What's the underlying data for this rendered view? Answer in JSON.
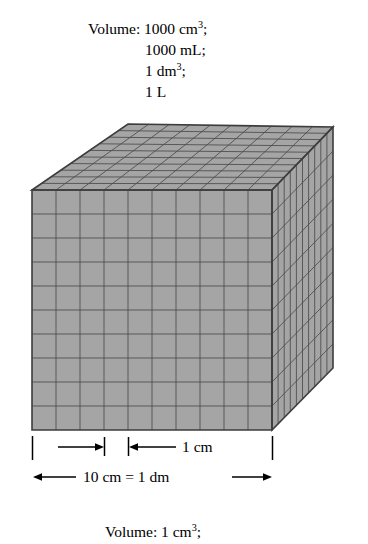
{
  "figure": {
    "title_top": {
      "lines": [
        {
          "text": "Volume: 1000 cm3;",
          "prefix": "Volume: 1000 cm",
          "sup": "3",
          "suffix": ";",
          "indent": false
        },
        {
          "text": "1000 mL;",
          "prefix": "1000 mL;",
          "sup": "",
          "suffix": "",
          "indent": true
        },
        {
          "text": "1 dm3;",
          "prefix": "1 dm",
          "sup": "3",
          "suffix": ";",
          "indent": true
        },
        {
          "text": "1 L",
          "prefix": "1 L",
          "sup": "",
          "suffix": "",
          "indent": true
        }
      ]
    },
    "caption_bottom": {
      "prefix": "Volume: 1 cm",
      "sup": "3",
      "suffix": ";"
    },
    "dimensions": {
      "unit_label": "1 cm",
      "total_label": "10 cm = 1 dm"
    },
    "cube": {
      "divisions_x": 10,
      "divisions_y": 10,
      "divisions_z": 10,
      "total_unit_cubes": 1000
    },
    "colors": {
      "background": "#ffffff",
      "face": "#a5a5a5",
      "grid_line": "#4a4a4a",
      "outline": "#3d3d3d",
      "text": "#000000"
    }
  },
  "chart_data": {
    "type": "diagram",
    "title": "Volume: 1000 cm3; 1000 mL; 1 dm3; 1 L",
    "subtitle": "Volume: 1 cm3;",
    "shape": "cube",
    "edge_length_cm": 10,
    "edge_length_dm": 1,
    "unit_cube_edge_cm": 1,
    "unit_cubes_per_edge": 10,
    "total_unit_cubes": 1000,
    "equivalences": [
      {
        "value": 1000,
        "unit": "cm3"
      },
      {
        "value": 1000,
        "unit": "mL"
      },
      {
        "value": 1,
        "unit": "dm3"
      },
      {
        "value": 1,
        "unit": "L"
      }
    ],
    "annotations": [
      "1 cm",
      "10 cm = 1 dm"
    ]
  }
}
